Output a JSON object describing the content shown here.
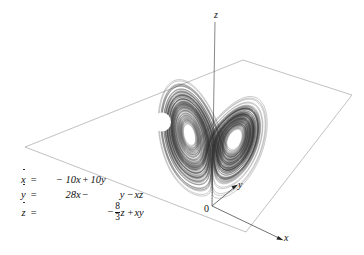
{
  "figure": {
    "background_color": "#ffffff",
    "ink_color": "#111111",
    "trajectory_color": "#333333"
  },
  "axes": {
    "z_label": "z",
    "y_label": "y",
    "x_label": "x",
    "origin_label": "0"
  },
  "equations": {
    "lhs": [
      "x",
      "y",
      "z"
    ],
    "equals": "=",
    "rows": [
      {
        "c1": "-10x",
        "op1": "+",
        "c2": "10y",
        "op2": "",
        "c3": ""
      },
      {
        "c1": "28x",
        "op1": "−",
        "c2": "y",
        "op2": "−",
        "c3": "xz"
      },
      {
        "c1": "",
        "op1": "−",
        "c2": "8/3 z",
        "op2": "+",
        "c3": "xy"
      }
    ],
    "sigma_minus": "− 10x",
    "sigma_plus": "+ 10y",
    "rho_term": "28x",
    "minus_y": "−  y",
    "minus_xz": "− xz",
    "beta_numerator": "8",
    "beta_denominator": "3",
    "beta_var": "z",
    "beta_sign": "−",
    "plus_xy": "+ xy",
    "minus": "−",
    "plus": "+"
  },
  "chart_data": {
    "type": "line",
    "system": "Lorenz equations",
    "parameters": {
      "sigma": 10,
      "rho": 28,
      "beta": 2.6667
    },
    "xlabel": "x",
    "ylabel": "y",
    "zlabel": "z",
    "projection": "3d-perspective",
    "grid": false,
    "legend": false,
    "lobes": 2
  }
}
